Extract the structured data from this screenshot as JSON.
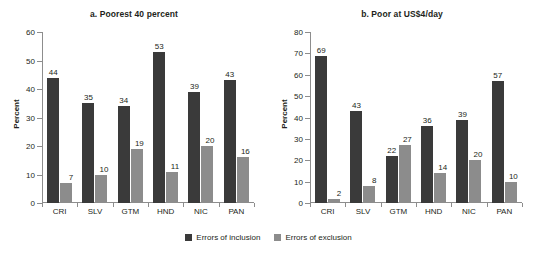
{
  "figure": {
    "ylabel": "Percent",
    "legend": [
      {
        "label": "Errors of inclusion",
        "color": "#3a3a3a",
        "key": "inclusion"
      },
      {
        "label": "Errors of exclusion",
        "color": "#8c8c8c",
        "key": "exclusion"
      }
    ]
  },
  "chart_data": [
    {
      "type": "bar",
      "title": "a. Poorest 40 percent",
      "xlabel": "",
      "ylabel": "Percent",
      "ylim": [
        0,
        60
      ],
      "yticks": [
        0,
        10,
        20,
        30,
        40,
        50,
        60
      ],
      "grid": false,
      "legend_position": "bottom-center-shared",
      "categories": [
        "CRI",
        "SLV",
        "GTM",
        "HND",
        "NIC",
        "PAN"
      ],
      "series": [
        {
          "name": "Errors of inclusion",
          "color": "#3a3a3a",
          "values": [
            44,
            35,
            34,
            53,
            39,
            43
          ]
        },
        {
          "name": "Errors of exclusion",
          "color": "#8c8c8c",
          "values": [
            7,
            10,
            19,
            11,
            20,
            16
          ]
        }
      ]
    },
    {
      "type": "bar",
      "title": "b. Poor at US$4/day",
      "xlabel": "",
      "ylabel": "Percent",
      "ylim": [
        0,
        80
      ],
      "yticks": [
        0,
        10,
        20,
        30,
        40,
        50,
        60,
        70,
        80
      ],
      "grid": false,
      "legend_position": "bottom-center-shared",
      "categories": [
        "CRI",
        "SLV",
        "GTM",
        "HND",
        "NIC",
        "PAN"
      ],
      "series": [
        {
          "name": "Errors of inclusion",
          "color": "#3a3a3a",
          "values": [
            69,
            43,
            22,
            36,
            39,
            57
          ]
        },
        {
          "name": "Errors of exclusion",
          "color": "#8c8c8c",
          "values": [
            2,
            8,
            27,
            14,
            20,
            10
          ]
        }
      ]
    }
  ]
}
